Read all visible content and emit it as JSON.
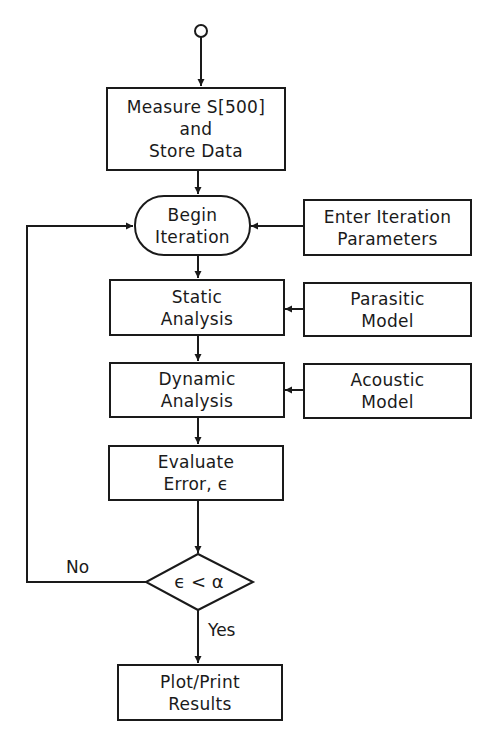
{
  "flowchart": {
    "start": {
      "shape": "circle",
      "icon": "start-terminal-circle"
    },
    "nodes": {
      "measure": {
        "lines": [
          "Measure S[500]",
          "and",
          "Store Data"
        ],
        "shape": "rectangle"
      },
      "begin": {
        "lines": [
          "Begin",
          "Iteration"
        ],
        "shape": "rounded-terminal"
      },
      "enter_params": {
        "lines": [
          "Enter Iteration",
          "Parameters"
        ],
        "shape": "rectangle"
      },
      "static": {
        "lines": [
          "Static",
          "Analysis"
        ],
        "shape": "rectangle"
      },
      "parasitic": {
        "lines": [
          "Parasitic",
          "Model"
        ],
        "shape": "rectangle"
      },
      "dynamic": {
        "lines": [
          "Dynamic",
          "Analysis"
        ],
        "shape": "rectangle"
      },
      "acoustic": {
        "lines": [
          "Acoustic",
          "Model"
        ],
        "shape": "rectangle"
      },
      "evaluate": {
        "lines": [
          "Evaluate",
          "Error, ϵ"
        ],
        "shape": "rectangle"
      },
      "decision": {
        "text": "ϵ < α",
        "shape": "diamond"
      },
      "plot": {
        "lines": [
          "Plot/Print",
          "Results"
        ],
        "shape": "rectangle"
      }
    },
    "edge_labels": {
      "no": "No",
      "yes": "Yes"
    },
    "edges": [
      [
        "start",
        "measure"
      ],
      [
        "measure",
        "begin"
      ],
      [
        "enter_params",
        "begin"
      ],
      [
        "begin",
        "static"
      ],
      [
        "parasitic",
        "static"
      ],
      [
        "static",
        "dynamic"
      ],
      [
        "acoustic",
        "dynamic"
      ],
      [
        "dynamic",
        "evaluate"
      ],
      [
        "evaluate",
        "decision"
      ],
      [
        "decision",
        "begin",
        "No"
      ],
      [
        "decision",
        "plot",
        "Yes"
      ]
    ]
  }
}
